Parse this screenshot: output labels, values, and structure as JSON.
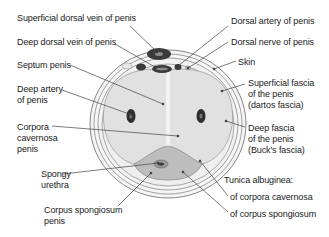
{
  "diagram": {
    "colors": {
      "background": "#ffffff",
      "outer_layers": "#f2f2f2",
      "corpora_fill": "#e3e3e3",
      "corpus_spongiosum_fill": "#bdbdbd",
      "vein_dark": "#3a3a3a",
      "lines": "#444444",
      "text": "#222222"
    },
    "labels_left": [
      {
        "id": "superficial-dorsal-vein",
        "lines": [
          "Superficial dorsal vein of penis"
        ]
      },
      {
        "id": "deep-dorsal-vein",
        "lines": [
          "Deep dorsal vein of penis"
        ]
      },
      {
        "id": "septum-penis",
        "lines": [
          "Septum penis"
        ]
      },
      {
        "id": "deep-artery",
        "lines": [
          "Deep artery",
          "of penis"
        ]
      },
      {
        "id": "corpora-cavernosa",
        "lines": [
          "Corpora",
          "cavernosa",
          "penis"
        ]
      },
      {
        "id": "spongy-urethra",
        "lines": [
          "Spongy",
          "urethra"
        ]
      },
      {
        "id": "corpus-spongiosum",
        "lines": [
          "Corpus spongiosum",
          "penis"
        ]
      }
    ],
    "labels_right": [
      {
        "id": "dorsal-artery",
        "lines": [
          "Dorsal artery of penis"
        ]
      },
      {
        "id": "dorsal-nerve",
        "lines": [
          "Dorsal nerve of penis"
        ]
      },
      {
        "id": "skin",
        "lines": [
          "Skin"
        ]
      },
      {
        "id": "superficial-fascia",
        "lines": [
          "Superficial fascia",
          "of the penis",
          "(dartos fascia)"
        ]
      },
      {
        "id": "deep-fascia",
        "lines": [
          "Deep fascia",
          "of the penis",
          "(Buck's fascia)"
        ]
      },
      {
        "id": "tunica-albuginea",
        "lines": [
          "Tunica albuginea:"
        ]
      },
      {
        "id": "tunica-cavernosa",
        "lines": [
          "of corpora cavernosa"
        ]
      },
      {
        "id": "tunica-spongiosum",
        "lines": [
          "of corpus spongiosum"
        ]
      }
    ]
  }
}
